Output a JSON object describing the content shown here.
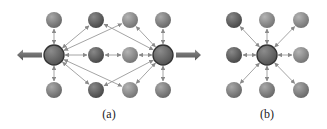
{
  "colors": {
    "node_fill": "#7a7a7a",
    "node_dark": "#555555",
    "node_light": "#8e8e8e",
    "hub_stroke": "#333333",
    "edge": "#9a9a9a",
    "big_arrow": "#6d6d6d"
  },
  "diagram_a": {
    "caption": "(a)",
    "hubs": [
      {
        "id": "hubL",
        "x": 54,
        "y": 55
      },
      {
        "id": "hubR",
        "x": 163,
        "y": 55
      }
    ],
    "nodes": [
      {
        "id": "t1",
        "x": 54,
        "y": 20,
        "shade": "mid"
      },
      {
        "id": "t2",
        "x": 96,
        "y": 20,
        "shade": "dark"
      },
      {
        "id": "t3",
        "x": 130,
        "y": 20,
        "shade": "light"
      },
      {
        "id": "t4",
        "x": 163,
        "y": 20,
        "shade": "mid"
      },
      {
        "id": "m1",
        "x": 96,
        "y": 55,
        "shade": "dark"
      },
      {
        "id": "m2",
        "x": 130,
        "y": 55,
        "shade": "light"
      },
      {
        "id": "b1",
        "x": 54,
        "y": 90,
        "shade": "mid"
      },
      {
        "id": "b2",
        "x": 96,
        "y": 90,
        "shade": "dark"
      },
      {
        "id": "b3",
        "x": 130,
        "y": 90,
        "shade": "light"
      },
      {
        "id": "b4",
        "x": 163,
        "y": 90,
        "shade": "mid"
      }
    ],
    "edges": [
      [
        "hubL",
        "t1"
      ],
      [
        "hubL",
        "b1"
      ],
      [
        "hubL",
        "m1"
      ],
      [
        "hubL",
        "t2"
      ],
      [
        "hubL",
        "b2"
      ],
      [
        "hubL",
        "t3"
      ],
      [
        "hubL",
        "b3"
      ],
      [
        "hubR",
        "t4"
      ],
      [
        "hubR",
        "b4"
      ],
      [
        "hubR",
        "m2"
      ],
      [
        "hubR",
        "t3"
      ],
      [
        "hubR",
        "b3"
      ],
      [
        "hubR",
        "t2"
      ],
      [
        "hubR",
        "b2"
      ],
      [
        "m1",
        "m2"
      ]
    ],
    "big_arrows": [
      {
        "from": [
          42,
          55
        ],
        "to": [
          17,
          55
        ],
        "direction": "left"
      },
      {
        "from": [
          176,
          55
        ],
        "to": [
          201,
          55
        ],
        "direction": "right"
      }
    ]
  },
  "diagram_b": {
    "caption": "(b)",
    "hub": {
      "id": "center",
      "x": 267,
      "y": 55
    },
    "nodes": [
      {
        "id": "nw",
        "x": 234,
        "y": 20,
        "shade": "dark"
      },
      {
        "id": "n",
        "x": 267,
        "y": 20,
        "shade": "light"
      },
      {
        "id": "ne",
        "x": 301,
        "y": 20,
        "shade": "light"
      },
      {
        "id": "w",
        "x": 234,
        "y": 55,
        "shade": "dark"
      },
      {
        "id": "e",
        "x": 301,
        "y": 55,
        "shade": "light"
      },
      {
        "id": "sw",
        "x": 234,
        "y": 90,
        "shade": "mid"
      },
      {
        "id": "s",
        "x": 267,
        "y": 90,
        "shade": "mid"
      },
      {
        "id": "se",
        "x": 301,
        "y": 90,
        "shade": "mid"
      }
    ]
  }
}
